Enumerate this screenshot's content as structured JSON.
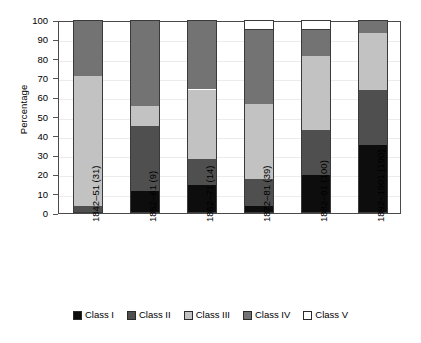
{
  "chart_data": {
    "type": "bar",
    "subtype": "stacked-percentage",
    "title": "",
    "xlabel": "",
    "ylabel": "Percentage",
    "ylim": [
      0,
      100
    ],
    "yticks": [
      0,
      10,
      20,
      30,
      40,
      50,
      60,
      70,
      80,
      90,
      100
    ],
    "ytick_labels": [
      "0",
      "10",
      "20",
      "30",
      "40",
      "50",
      "60",
      "70",
      "80",
      "90",
      "100"
    ],
    "grid": true,
    "legend_position": "bottom",
    "categories": [
      "1842–51 (31)",
      "1852–61 (9)",
      "1862–71 (14)",
      "1872–81 (39)",
      "1882–91 (100)",
      "1892–1901 (190)"
    ],
    "series": [
      {
        "name": "Class I",
        "color": "#0d0d0d",
        "values": [
          0.0,
          11.2,
          14.4,
          3.4,
          19.6,
          35.5
        ]
      },
      {
        "name": "Class II",
        "color": "#4f4f4f",
        "values": [
          3.6,
          33.8,
          13.6,
          14.4,
          23.4,
          28.0
        ]
      },
      {
        "name": "Class III",
        "color": "#c2c2c2",
        "values": [
          67.4,
          10.5,
          36.0,
          38.5,
          38.5,
          30.0
        ]
      },
      {
        "name": "Class IV",
        "color": "#737373",
        "values": [
          29.0,
          44.5,
          36.0,
          38.7,
          13.5,
          6.5
        ]
      },
      {
        "name": "Class V",
        "color": "#ffffff",
        "values": [
          0.0,
          0.0,
          0.0,
          5.0,
          5.0,
          0.0
        ]
      }
    ],
    "cumulative_tops": [
      [
        3.6,
        71.0,
        100.0,
        100.0
      ],
      [
        11.2,
        45.0,
        55.5,
        100.0
      ],
      [
        14.4,
        28.0,
        64.0,
        100.0
      ],
      [
        3.4,
        17.8,
        56.3,
        95.0
      ],
      [
        19.6,
        43.0,
        81.5,
        95.0
      ],
      [
        35.5,
        63.5,
        93.5,
        100.0
      ]
    ]
  },
  "legend": {
    "items": [
      {
        "label": "Class I"
      },
      {
        "label": "Class II"
      },
      {
        "label": "Class III"
      },
      {
        "label": "Class IV"
      },
      {
        "label": "Class V"
      }
    ]
  }
}
